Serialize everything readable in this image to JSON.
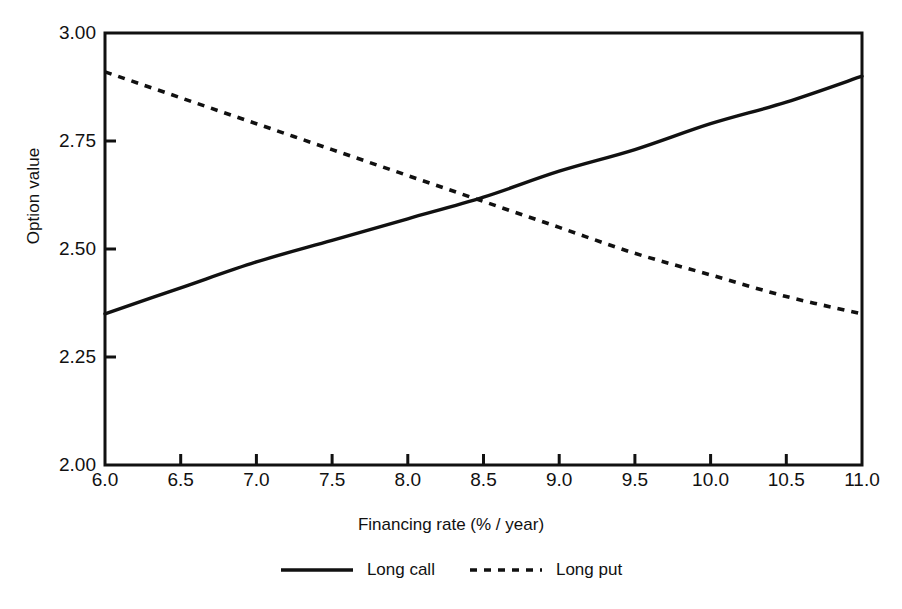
{
  "figure": {
    "background_color": "#ffffff",
    "ink_color": "#111111"
  },
  "chart_data": {
    "type": "line",
    "title": "",
    "subtitle": "",
    "xlabel": "Financing rate (% / year)",
    "ylabel": "Option value",
    "xlim": [
      6.0,
      11.0
    ],
    "ylim": [
      2.0,
      3.0
    ],
    "xticks": [
      6.0,
      6.5,
      7.0,
      7.5,
      8.0,
      8.5,
      9.0,
      9.5,
      10.0,
      10.5,
      11.0
    ],
    "xtick_labels": [
      "6.0",
      "6.5",
      "7.0",
      "7.5",
      "8.0",
      "8.5",
      "9.0",
      "9.5",
      "10.0",
      "10.5",
      "11.0"
    ],
    "yticks": [
      2.0,
      2.25,
      2.5,
      2.75,
      3.0
    ],
    "ytick_labels": [
      "2.00",
      "2.25",
      "2.50",
      "2.75",
      "3.00"
    ],
    "grid": false,
    "legend_position": "below-axes",
    "tick_direction": "in",
    "frame": "full-box",
    "x": [
      6.0,
      6.5,
      7.0,
      7.5,
      8.0,
      8.5,
      9.0,
      9.5,
      10.0,
      10.5,
      11.0
    ],
    "series": [
      {
        "name": "Long call",
        "style": "solid",
        "color": "#111111",
        "values": [
          2.35,
          2.41,
          2.47,
          2.52,
          2.57,
          2.62,
          2.68,
          2.73,
          2.79,
          2.84,
          2.9
        ]
      },
      {
        "name": "Long put",
        "style": "dashed",
        "color": "#111111",
        "values": [
          2.91,
          2.85,
          2.79,
          2.73,
          2.67,
          2.61,
          2.55,
          2.49,
          2.44,
          2.39,
          2.35
        ]
      }
    ],
    "annotations": [
      {
        "type": "intersection",
        "x": 8.48,
        "y": 2.61,
        "label": ""
      }
    ]
  },
  "legend": {
    "entries": [
      {
        "label": "Long call",
        "style": "solid"
      },
      {
        "label": "Long put",
        "style": "dashed"
      }
    ]
  }
}
